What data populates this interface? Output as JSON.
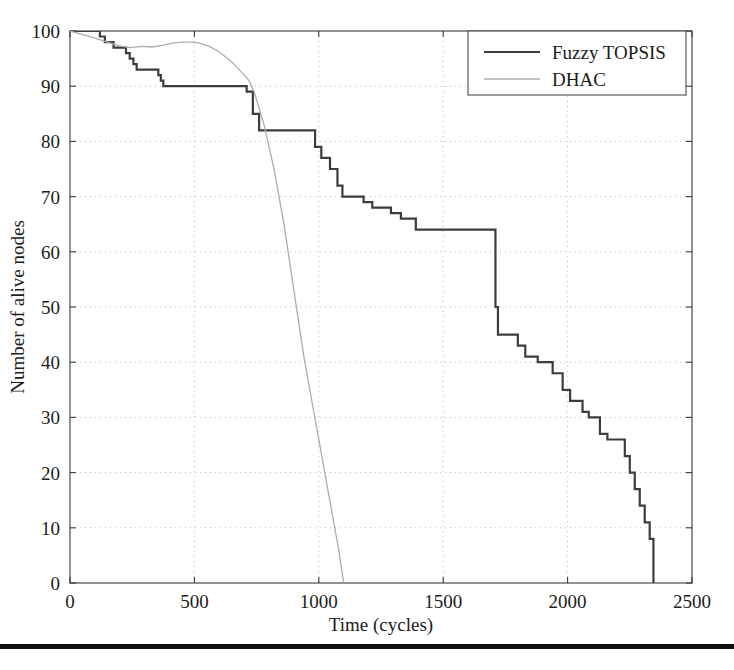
{
  "chart_data": {
    "type": "line",
    "title": "",
    "subtitle": "",
    "xlabel": "Time (cycles)",
    "ylabel": "Number of alive nodes",
    "xlim": [
      0,
      2500
    ],
    "ylim": [
      0,
      100
    ],
    "xticks": [
      0,
      500,
      1000,
      1500,
      2000,
      2500
    ],
    "xtick_labels": [
      "0",
      "500",
      "1000",
      "1500",
      "2000",
      "2500"
    ],
    "yticks": [
      0,
      10,
      20,
      30,
      40,
      50,
      60,
      70,
      80,
      90,
      100
    ],
    "ytick_labels": [
      "0",
      "10",
      "20",
      "30",
      "40",
      "50",
      "60",
      "70",
      "80",
      "90",
      "100"
    ],
    "grid": true,
    "grid_style": "dotted",
    "legend_position": "top-right",
    "series": [
      {
        "name": "Fuzzy TOPSIS",
        "color": "#3d3d3d",
        "line_width": 2.2,
        "style": "step",
        "points": [
          [
            0,
            100
          ],
          [
            120,
            100
          ],
          [
            120,
            99
          ],
          [
            140,
            99
          ],
          [
            140,
            98
          ],
          [
            175,
            98
          ],
          [
            175,
            97
          ],
          [
            225,
            97
          ],
          [
            225,
            96
          ],
          [
            240,
            96
          ],
          [
            240,
            95
          ],
          [
            255,
            95
          ],
          [
            255,
            94
          ],
          [
            268,
            94
          ],
          [
            268,
            93
          ],
          [
            355,
            93
          ],
          [
            355,
            92
          ],
          [
            365,
            92
          ],
          [
            365,
            91
          ],
          [
            375,
            91
          ],
          [
            375,
            90
          ],
          [
            710,
            90
          ],
          [
            710,
            89
          ],
          [
            735,
            89
          ],
          [
            735,
            85
          ],
          [
            760,
            85
          ],
          [
            760,
            82
          ],
          [
            985,
            82
          ],
          [
            985,
            79
          ],
          [
            1010,
            79
          ],
          [
            1010,
            77
          ],
          [
            1045,
            77
          ],
          [
            1045,
            75
          ],
          [
            1075,
            75
          ],
          [
            1075,
            72
          ],
          [
            1095,
            72
          ],
          [
            1095,
            70
          ],
          [
            1180,
            70
          ],
          [
            1180,
            69
          ],
          [
            1215,
            69
          ],
          [
            1215,
            68
          ],
          [
            1290,
            68
          ],
          [
            1290,
            67
          ],
          [
            1330,
            67
          ],
          [
            1330,
            66
          ],
          [
            1390,
            66
          ],
          [
            1390,
            64
          ],
          [
            1710,
            64
          ],
          [
            1710,
            50
          ],
          [
            1720,
            50
          ],
          [
            1720,
            45
          ],
          [
            1800,
            45
          ],
          [
            1800,
            43
          ],
          [
            1830,
            43
          ],
          [
            1830,
            41
          ],
          [
            1880,
            41
          ],
          [
            1880,
            40
          ],
          [
            1940,
            40
          ],
          [
            1940,
            38
          ],
          [
            1980,
            38
          ],
          [
            1980,
            35
          ],
          [
            2010,
            35
          ],
          [
            2010,
            33
          ],
          [
            2060,
            33
          ],
          [
            2060,
            31
          ],
          [
            2085,
            31
          ],
          [
            2085,
            30
          ],
          [
            2130,
            30
          ],
          [
            2130,
            27
          ],
          [
            2160,
            27
          ],
          [
            2160,
            26
          ],
          [
            2230,
            26
          ],
          [
            2230,
            23
          ],
          [
            2250,
            23
          ],
          [
            2250,
            20
          ],
          [
            2270,
            20
          ],
          [
            2270,
            17
          ],
          [
            2290,
            17
          ],
          [
            2290,
            14
          ],
          [
            2310,
            14
          ],
          [
            2310,
            11
          ],
          [
            2330,
            11
          ],
          [
            2330,
            8
          ],
          [
            2345,
            8
          ],
          [
            2345,
            0
          ]
        ]
      },
      {
        "name": "DHAC",
        "color": "#adadad",
        "line_width": 1.3,
        "style": "smooth",
        "points": [
          [
            0,
            100
          ],
          [
            80,
            99
          ],
          [
            150,
            98
          ],
          [
            200,
            97.3
          ],
          [
            240,
            97
          ],
          [
            290,
            97.2
          ],
          [
            330,
            97.1
          ],
          [
            370,
            97.4
          ],
          [
            410,
            97.8
          ],
          [
            450,
            98
          ],
          [
            490,
            98
          ],
          [
            520,
            97.8
          ],
          [
            560,
            97.2
          ],
          [
            600,
            96.2
          ],
          [
            640,
            94.8
          ],
          [
            670,
            93.5
          ],
          [
            700,
            92
          ],
          [
            720,
            91
          ],
          [
            740,
            89
          ],
          [
            760,
            86
          ],
          [
            780,
            83
          ],
          [
            800,
            79
          ],
          [
            820,
            75
          ],
          [
            840,
            70
          ],
          [
            860,
            65
          ],
          [
            880,
            59
          ],
          [
            900,
            53
          ],
          [
            920,
            47
          ],
          [
            940,
            41
          ],
          [
            960,
            36
          ],
          [
            980,
            31
          ],
          [
            1000,
            26
          ],
          [
            1020,
            21
          ],
          [
            1040,
            16
          ],
          [
            1060,
            11
          ],
          [
            1080,
            6
          ],
          [
            1100,
            0
          ]
        ]
      }
    ]
  },
  "legend": {
    "items": [
      {
        "label": "Fuzzy TOPSIS",
        "color": "#3d3d3d",
        "line_width": 2.2
      },
      {
        "label": "DHAC",
        "color": "#adadad",
        "line_width": 1.3
      }
    ]
  },
  "axes": {
    "x_title": "Time (cycles)",
    "y_title": "Number of alive nodes"
  },
  "colors": {
    "axis": "#3a3a3a",
    "grid": "#b9b9b9",
    "background": "#ffffff",
    "rule": "#111111"
  }
}
